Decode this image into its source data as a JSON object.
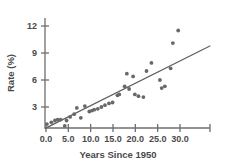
{
  "chart_data": {
    "type": "scatter",
    "title": "",
    "xlabel": "Years Since 1950",
    "ylabel": "Rate (%)",
    "xlim": [
      -1.5,
      36.5
    ],
    "ylim": [
      0,
      13.2
    ],
    "grid": false,
    "legend": null,
    "xticks": [
      "0.0",
      "5.0",
      "10.0",
      "15.0",
      "20.0",
      "25.0",
      "30.0"
    ],
    "xtick_values": [
      0.0,
      5.0,
      10.0,
      15.0,
      20.0,
      25.0,
      30.0
    ],
    "yticks": [
      "3",
      "6",
      "9",
      "12"
    ],
    "ytick_values": [
      3,
      6,
      9,
      12
    ],
    "points": [
      [
        0.2,
        1.1
      ],
      [
        1.2,
        1.3
      ],
      [
        2.0,
        1.5
      ],
      [
        2.6,
        1.6
      ],
      [
        3.3,
        1.6
      ],
      [
        4.2,
        0.9
      ],
      [
        4.6,
        1.5
      ],
      [
        5.4,
        1.9
      ],
      [
        6.3,
        2.2
      ],
      [
        6.9,
        2.9
      ],
      [
        7.8,
        1.8
      ],
      [
        8.7,
        3.1
      ],
      [
        9.7,
        2.5
      ],
      [
        10.3,
        2.6
      ],
      [
        10.8,
        2.7
      ],
      [
        11.6,
        2.8
      ],
      [
        12.4,
        3.0
      ],
      [
        13.2,
        3.2
      ],
      [
        14.1,
        3.4
      ],
      [
        14.9,
        3.5
      ],
      [
        16.0,
        4.3
      ],
      [
        16.4,
        4.4
      ],
      [
        17.6,
        5.3
      ],
      [
        18.1,
        6.7
      ],
      [
        18.6,
        5.0
      ],
      [
        19.5,
        6.4
      ],
      [
        19.9,
        4.4
      ],
      [
        20.7,
        4.2
      ],
      [
        21.8,
        4.1
      ],
      [
        22.5,
        7.0
      ],
      [
        23.6,
        7.9
      ],
      [
        25.5,
        6.0
      ],
      [
        25.9,
        5.1
      ],
      [
        26.6,
        5.3
      ],
      [
        27.9,
        7.3
      ],
      [
        28.4,
        10.1
      ],
      [
        29.6,
        11.5
      ]
    ],
    "trend_line": {
      "x_start": -0.3,
      "y_start": 0.6,
      "x_end": 36.8,
      "y_end": 9.8
    },
    "series_name": "Rate vs Years Since 1950",
    "colors": {
      "point": "#66686b",
      "trend": "#5f5f5f",
      "axis": "#6e6e6e",
      "text": "#4a4a4a",
      "background": "#ffffff"
    }
  }
}
